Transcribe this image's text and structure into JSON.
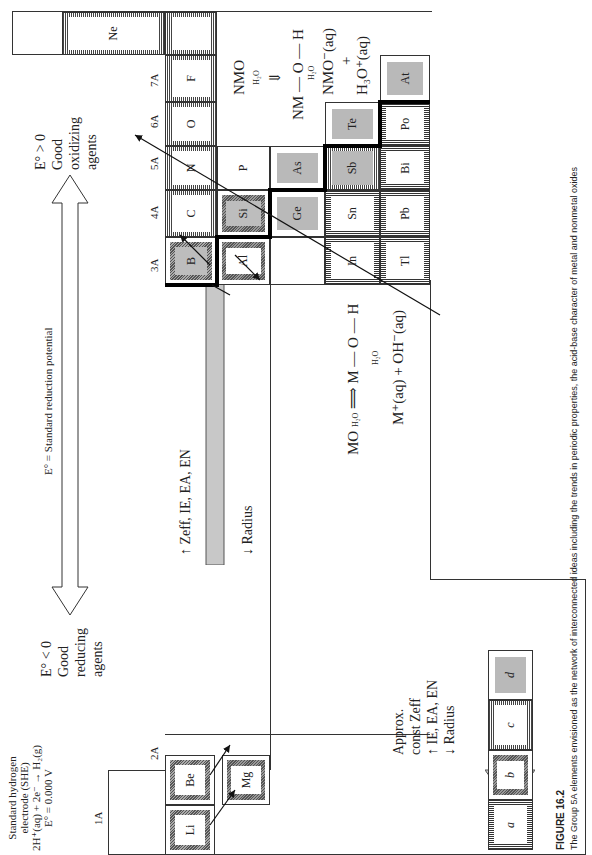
{
  "figure": {
    "label": "FIGURE 16.2",
    "caption": "The Group 5A elements envisioned as the network of interconnected ideas including the trends in periodic properties, the acid-base character of metal and nonmetal oxides"
  },
  "she": {
    "line1": "Standard hydrogen",
    "line2": "electrode (SHE)",
    "line3": "2H⁺(aq) + 2e⁻ → H₂(g)",
    "line4": "E° = 0.000 V"
  },
  "potential_axis": {
    "label": "E° = Standard reduction potential",
    "left_label": [
      "E° < 0",
      "Good",
      "reducing",
      "agents"
    ],
    "right_label": [
      "E° > 0",
      "Good",
      "oxidizing",
      "agents"
    ]
  },
  "trend_arrow": {
    "line1": "↑  Zeff, IE, EA, EN",
    "line2": "↓  Radius"
  },
  "group_trend": {
    "lines": [
      "Approx.",
      "const Zeff",
      "↑  IE, EA, EN",
      "↓  Radius"
    ]
  },
  "groups": [
    "1A",
    "2A",
    "3A",
    "4A",
    "5A",
    "6A",
    "7A",
    "8A"
  ],
  "elements": {
    "Li": "Li",
    "Be": "Be",
    "Mg": "Mg",
    "B": "B",
    "Al": "Al",
    "C": "C",
    "Si": "Si",
    "Ge": "Ge",
    "Sn": "Sn",
    "Pb": "Pb",
    "N": "N",
    "P": "P",
    "As": "As",
    "Sb": "Sb",
    "Bi": "Bi",
    "O": "O",
    "Te": "Te",
    "Po": "Po",
    "F": "F",
    "At": "At",
    "Ne": "Ne",
    "In": "In",
    "Tl": "Tl"
  },
  "metal_oxide_eq": {
    "line1_left": "MO",
    "line1_over": "H₂O",
    "line1_right": "M — O — H",
    "line2_over": "H₂O",
    "line3": "M⁺(aq) + OH⁻(aq)"
  },
  "nonmetal_oxide_eq": {
    "line1": "NMO",
    "line1_over": "H₂O",
    "line2": "NM — O — H",
    "line2_over": "H₂O",
    "line3": "NMO⁻(aq)",
    "line4": "+",
    "line5": "H₃O⁺(aq)"
  },
  "legend": [
    "a",
    "b",
    "c",
    "d"
  ],
  "colors": {
    "arrow_fill": "#c8c8c8",
    "metalloid_gray": "#b9b9b9",
    "line": "#333333"
  }
}
